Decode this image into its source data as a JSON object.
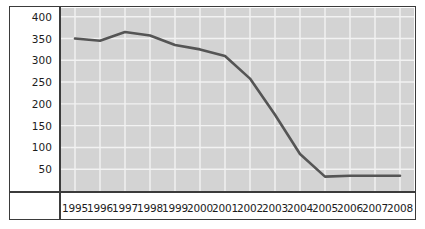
{
  "chart_data": {
    "type": "line",
    "title": "",
    "subtitle": "",
    "xlabel": "",
    "ylabel": "",
    "categories": [
      "1995",
      "1996",
      "1997",
      "1998",
      "1999",
      "2000",
      "2001",
      "2002",
      "2003",
      "2004",
      "2005",
      "2006",
      "2007",
      "2008"
    ],
    "values": [
      350,
      345,
      365,
      357,
      335,
      325,
      310,
      258,
      175,
      85,
      33,
      35,
      35,
      35
    ],
    "series": [
      {
        "name": "series-1",
        "color": "#555555",
        "values": [
          350,
          345,
          365,
          357,
          335,
          325,
          310,
          258,
          175,
          85,
          33,
          35,
          35,
          35
        ]
      }
    ],
    "ylim": [
      0,
      420
    ],
    "xlim": [
      1995,
      2008
    ],
    "y_ticks": [
      400,
      350,
      300,
      250,
      200,
      150,
      100,
      50
    ],
    "y_tick_labels": [
      "400",
      "350",
      "300",
      "250",
      "200",
      "150",
      "100",
      "50"
    ],
    "x_ticks": [
      1995,
      1996,
      1997,
      1998,
      1999,
      2000,
      2001,
      2002,
      2003,
      2004,
      2005,
      2006,
      2007,
      2008
    ],
    "x_tick_labels": [
      "1995",
      "1996",
      "1997",
      "1998",
      "1999",
      "2000",
      "2001",
      "2002",
      "2003",
      "2004",
      "2005",
      "2006",
      "2007",
      "2008"
    ],
    "grid": true,
    "grid_color": "#f2f2f2",
    "plot_background": "#d3d3d3",
    "legend": null,
    "legend_position": "none",
    "annotations": []
  },
  "colors": {
    "line": "#555555",
    "frame": "#3b3b3b",
    "panel": "#d3d3d3",
    "grid": "#f2f2f2",
    "figure_background": "#ffffff",
    "tick_label": "#1c1c1c"
  }
}
